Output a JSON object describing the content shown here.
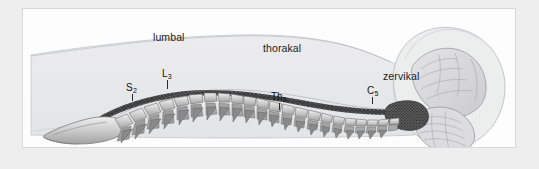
{
  "figure": {
    "width": 539,
    "height": 169,
    "frame_color": "#eeeeee",
    "panel_color": "#fdfdfd",
    "panel_border_color": "#d8d8d8"
  },
  "colors": {
    "body_silhouette": "#e9eaec",
    "body_outline": "#b9bcc0",
    "bone_light": "#e2e2e2",
    "bone_mid": "#bdbdbd",
    "bone_dark": "#8f8f8f",
    "bone_outline": "#6e6e6e",
    "spinal_cord": "#4a4a4a",
    "brain_fill": "#dcdcde",
    "brain_outline": "#9a9a9d",
    "label_text": "#1c1c1c"
  },
  "region_labels": [
    {
      "id": "lumbal",
      "text": "lumbal",
      "x": 152,
      "y": 30
    },
    {
      "id": "thorakal",
      "text": "thorakal",
      "x": 262,
      "y": 41
    },
    {
      "id": "zervikal",
      "text": "zervikal",
      "x": 382,
      "y": 69
    }
  ],
  "vertebra_labels": [
    {
      "id": "s2",
      "base": "S",
      "sub": "2",
      "x": 125,
      "y": 82,
      "tick_x": 131,
      "tick_y": 93,
      "tick_h": 7
    },
    {
      "id": "l3",
      "base": "L",
      "sub": "3",
      "x": 161,
      "y": 68,
      "tick_x": 166,
      "tick_y": 79,
      "tick_h": 9
    },
    {
      "id": "th5",
      "base": "Th",
      "sub": "5",
      "x": 270,
      "y": 91,
      "tick_x": 278,
      "tick_y": 102,
      "tick_h": 7
    },
    {
      "id": "c5",
      "base": "C",
      "sub": "5",
      "x": 366,
      "y": 85,
      "tick_x": 371,
      "tick_y": 96,
      "tick_h": 7
    }
  ],
  "anatomy": {
    "body_silhouette_path": "M 28 132 L 28 52 C 40 48 62 44 86 40 C 116 35 150 31 186 29 C 232 27 276 30 306 36 C 330 41 348 48 362 54 C 372 58 380 60 388 59 C 392 47 398 36 408 30 C 420 23 436 21 450 25 C 466 30 478 42 484 58 C 490 74 488 94 480 108 C 470 124 452 134 432 136 C 414 138 396 134 384 126 C 372 131 356 134 338 135 C 300 137 250 136 200 134 C 150 132 100 132 60 133 Z",
    "head_path": "M 388 59 C 392 45 400 33 412 27 C 426 20 444 21 458 29 C 474 38 484 56 484 76 C 484 96 476 114 462 126 C 448 137 428 140 412 134 C 398 129 388 118 383 105 C 379 92 380 73 388 59 Z",
    "cerebrum_path": "M 404 52 C 414 42 430 38 444 43 C 458 48 466 62 466 76 C 466 86 462 94 456 99 C 446 107 432 108 422 102 C 410 95 402 82 401 68 C 400 61 401 56 404 52 Z",
    "cerebellum_path": "M 408 102 C 418 96 432 96 442 102 C 454 109 460 122 456 132 C 452 141 440 145 428 142 C 414 139 404 128 403 116 C 402 110 404 105 408 102 Z",
    "brainstem_path": "M 386 96 C 394 92 404 92 410 96 C 416 100 418 108 414 114 C 410 120 400 122 392 119 C 384 116 380 108 382 102 C 383 99 384 97 386 96 Z",
    "sacrum_path": "M 44 124 C 52 118 64 114 78 112 C 92 110 104 112 112 116 C 118 119 120 124 116 128 C 110 133 96 136 80 136 C 64 136 50 133 44 129 C 42 127 42 125 44 124 Z",
    "cord_path": "M 100 116 C 120 104 148 94 180 90 C 214 86 252 90 288 97 C 322 104 356 108 384 106",
    "spine_path": "M 96 120 C 118 106 148 95 182 91 C 218 87 256 92 292 100 C 326 107 358 110 386 108"
  },
  "vertebrae": {
    "count": 30,
    "description": "Lateral chain of vertebral bodies from sacrum to atlas with posterior spinous processes"
  }
}
